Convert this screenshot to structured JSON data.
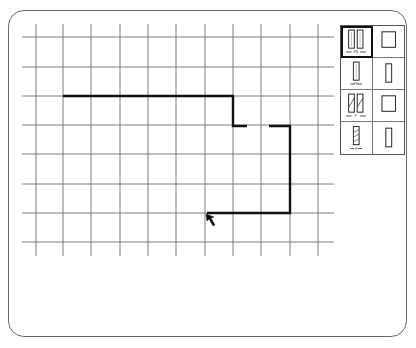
{
  "drawing_area": {
    "grid": {
      "x_lines": [
        36,
        63,
        91,
        120,
        148,
        176,
        205,
        233,
        261,
        290,
        318
      ],
      "y_lines": [
        37,
        67,
        96,
        125,
        154,
        184,
        213,
        242
      ],
      "x_extent": [
        22,
        334
      ],
      "y_extent": [
        24,
        256
      ],
      "line_color": "#6e6e6e"
    },
    "wall_path": {
      "color": "#111111",
      "segments": [
        "M63,96 L233,96 L233,126 L247,126",
        "M269,126 L290,126 L290,213 L207,213"
      ]
    },
    "cursor": {
      "icon": "arrow-pointer-icon",
      "tip": [
        206,
        214
      ]
    }
  },
  "palette": {
    "items": [
      {
        "name": "double-window-with-dimension",
        "selected": true,
        "label": "FB"
      },
      {
        "name": "large-square-window",
        "selected": false,
        "label": ""
      },
      {
        "name": "single-window-with-dimension",
        "selected": false,
        "label": "FB"
      },
      {
        "name": "narrow-window",
        "selected": false,
        "label": ""
      },
      {
        "name": "double-hatched-window-with-dimension",
        "selected": false,
        "label": "F"
      },
      {
        "name": "large-square-window-alt",
        "selected": false,
        "label": ""
      },
      {
        "name": "single-hatched-window-with-dimension",
        "selected": false,
        "label": "F"
      },
      {
        "name": "narrow-window-alt",
        "selected": false,
        "label": ""
      }
    ]
  },
  "caption": ""
}
